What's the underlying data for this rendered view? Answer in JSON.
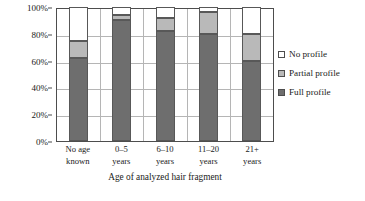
{
  "chart_data": {
    "type": "bar",
    "subtype": "stacked-percentage",
    "title": "",
    "xlabel": "Age of analyzed hair fragment",
    "ylabel": "Frequency",
    "categories": [
      "No age\nknown",
      "0–5\nyears",
      "6–10\nyears",
      "11–20\nyears",
      "21+\nyears"
    ],
    "category_lines": [
      [
        "No age",
        "known"
      ],
      [
        "0–5",
        "years"
      ],
      [
        "6–10",
        "years"
      ],
      [
        "11–20",
        "years"
      ],
      [
        "21+",
        "years"
      ]
    ],
    "series": [
      {
        "name": "Full profile",
        "color": "#6e6e6e",
        "values": [
          62,
          90,
          82,
          80,
          60
        ]
      },
      {
        "name": "Partial profile",
        "color": "#b9b9b9",
        "values": [
          13,
          4,
          10,
          16,
          20
        ]
      },
      {
        "name": "No profile",
        "color": "#ffffff",
        "values": [
          25,
          6,
          8,
          4,
          20
        ]
      }
    ],
    "stack_order_bottom_to_top": [
      "Full profile",
      "Partial profile",
      "No profile"
    ],
    "ylim": [
      0,
      100
    ],
    "yticks": [
      0,
      20,
      40,
      60,
      80,
      100
    ],
    "ytick_labels": [
      "0%",
      "20%",
      "40%",
      "60%",
      "80%",
      "100%"
    ],
    "grid": {
      "horizontal": true,
      "vertical": true
    },
    "legend": {
      "position": "right",
      "entries": [
        {
          "label": "No profile",
          "color": "#ffffff"
        },
        {
          "label": "Partial profile",
          "color": "#b9b9b9"
        },
        {
          "label": "Full profile",
          "color": "#6e6e6e"
        }
      ]
    }
  }
}
